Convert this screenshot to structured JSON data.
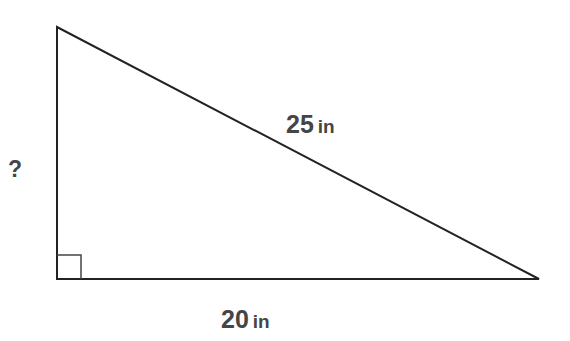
{
  "diagram": {
    "type": "right-triangle",
    "stroke_color": "#222222",
    "text_color": "#454545",
    "vertices": {
      "top": [
        57,
        27
      ],
      "right_angle": [
        57,
        279
      ],
      "right": [
        539,
        279
      ]
    },
    "right_angle_marker": {
      "x": 57,
      "y": 255,
      "size": 24
    },
    "sides": {
      "hypotenuse": {
        "value": "25",
        "unit": "in"
      },
      "base": {
        "value": "20",
        "unit": "in"
      },
      "height": {
        "value": "?"
      }
    }
  }
}
